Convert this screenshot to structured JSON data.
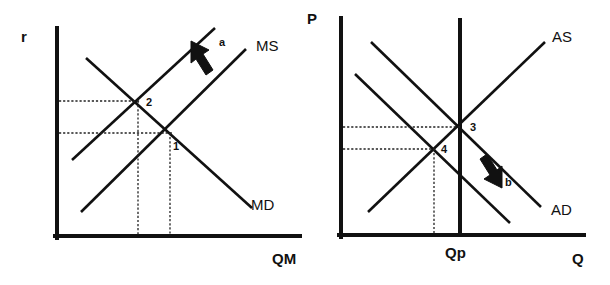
{
  "figure": {
    "background_color": "#ffffff",
    "ink_color": "#111111"
  },
  "left_panel": {
    "name": "money-market",
    "y_axis_label": "r",
    "x_axis_label": "QM",
    "curve_labels": {
      "supply": "MS",
      "demand": "MD"
    },
    "equilibrium_points": [
      {
        "id": "1",
        "label": "1"
      },
      {
        "id": "2",
        "label": "2"
      }
    ],
    "shift_arrow": {
      "label": "a",
      "direction": "up-left"
    }
  },
  "right_panel": {
    "name": "ad-as-market",
    "y_axis_label": "P",
    "x_axis_label": "Q",
    "potential_output_label": "Qp",
    "curve_labels": {
      "supply": "AS",
      "demand": "AD"
    },
    "equilibrium_points": [
      {
        "id": "3",
        "label": "3"
      },
      {
        "id": "4",
        "label": "4"
      }
    ],
    "shift_arrow": {
      "label": "b",
      "direction": "down-left"
    }
  }
}
